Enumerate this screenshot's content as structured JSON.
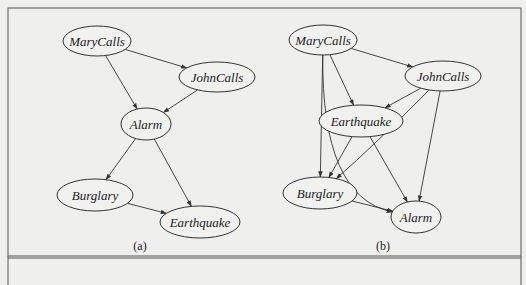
{
  "figure": {
    "panels": [
      {
        "id": "a",
        "caption": "(a)",
        "nodes": [
          {
            "id": "MaryCalls",
            "label": "MaryCalls",
            "cx": 97,
            "cy": 41,
            "rx": 34,
            "ry": 15
          },
          {
            "id": "JohnCalls",
            "label": "JohnCalls",
            "cx": 217,
            "cy": 77,
            "rx": 38,
            "ry": 15
          },
          {
            "id": "Alarm",
            "label": "Alarm",
            "cx": 146,
            "cy": 124,
            "rx": 25,
            "ry": 16
          },
          {
            "id": "Burglary",
            "label": "Burglary",
            "cx": 95,
            "cy": 195,
            "rx": 38,
            "ry": 16
          },
          {
            "id": "Earthquake",
            "label": "Earthquake",
            "cx": 200,
            "cy": 222,
            "rx": 40,
            "ry": 16
          }
        ],
        "edges": [
          {
            "from": "MaryCalls",
            "to": "JohnCalls"
          },
          {
            "from": "MaryCalls",
            "to": "Alarm"
          },
          {
            "from": "JohnCalls",
            "to": "Alarm"
          },
          {
            "from": "Alarm",
            "to": "Burglary"
          },
          {
            "from": "Alarm",
            "to": "Earthquake"
          },
          {
            "from": "Burglary",
            "to": "Earthquake"
          }
        ]
      },
      {
        "id": "b",
        "caption": "(b)",
        "nodes": [
          {
            "id": "MaryCalls",
            "label": "MaryCalls",
            "cx": 323,
            "cy": 40,
            "rx": 34,
            "ry": 15
          },
          {
            "id": "JohnCalls",
            "label": "JohnCalls",
            "cx": 443,
            "cy": 76,
            "rx": 38,
            "ry": 15
          },
          {
            "id": "Earthquake",
            "label": "Earthquake",
            "cx": 361,
            "cy": 121,
            "rx": 42,
            "ry": 16
          },
          {
            "id": "Burglary",
            "label": "Burglary",
            "cx": 320,
            "cy": 193,
            "rx": 37,
            "ry": 16
          },
          {
            "id": "Alarm",
            "label": "Alarm",
            "cx": 416,
            "cy": 217,
            "rx": 25,
            "ry": 16
          }
        ],
        "edges": [
          {
            "from": "MaryCalls",
            "to": "JohnCalls"
          },
          {
            "from": "MaryCalls",
            "to": "Earthquake"
          },
          {
            "from": "MaryCalls",
            "to": "Burglary"
          },
          {
            "from": "MaryCalls",
            "to": "Alarm",
            "curved": true
          },
          {
            "from": "JohnCalls",
            "to": "Earthquake"
          },
          {
            "from": "JohnCalls",
            "to": "Burglary",
            "curved": true
          },
          {
            "from": "JohnCalls",
            "to": "Alarm"
          },
          {
            "from": "Earthquake",
            "to": "Burglary"
          },
          {
            "from": "Earthquake",
            "to": "Alarm"
          },
          {
            "from": "Burglary",
            "to": "Alarm"
          }
        ]
      }
    ]
  }
}
